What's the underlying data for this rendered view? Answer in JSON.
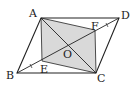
{
  "diagram": {
    "type": "geometry",
    "colors": {
      "stroke": "#222222",
      "shade": "#d9d9d9",
      "background": "#ffffff"
    },
    "points": {
      "A": {
        "label": "A",
        "x": 41,
        "y": 18
      },
      "D": {
        "label": "D",
        "x": 119,
        "y": 18
      },
      "B": {
        "label": "B",
        "x": 17,
        "y": 73
      },
      "C": {
        "label": "C",
        "x": 96,
        "y": 73
      },
      "O": {
        "label": "O",
        "x": 68,
        "y": 45
      },
      "E": {
        "label": "E",
        "x": 42,
        "y": 61
      },
      "F": {
        "label": "F",
        "x": 95,
        "y": 30
      }
    },
    "segments": [
      "AB",
      "BC",
      "CD",
      "DA",
      "AC",
      "BD",
      "AE",
      "EC",
      "CF",
      "FA"
    ],
    "shaded_region": [
      "A",
      "E",
      "C",
      "F"
    ]
  }
}
